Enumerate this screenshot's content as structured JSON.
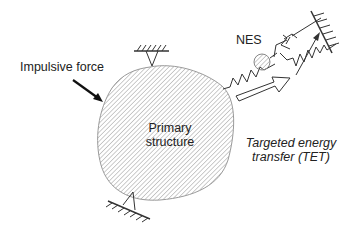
{
  "labels": {
    "impulsive_force": "Impulsive force",
    "primary_structure_line1": "Primary",
    "primary_structure_line2": "structure",
    "nes": "NES",
    "tet_line1": "Targeted energy",
    "tet_line2": "transfer (TET)"
  },
  "colors": {
    "stroke": "#333333",
    "hatch": "#9a9a9a",
    "text": "#222222",
    "background": "#ffffff"
  }
}
